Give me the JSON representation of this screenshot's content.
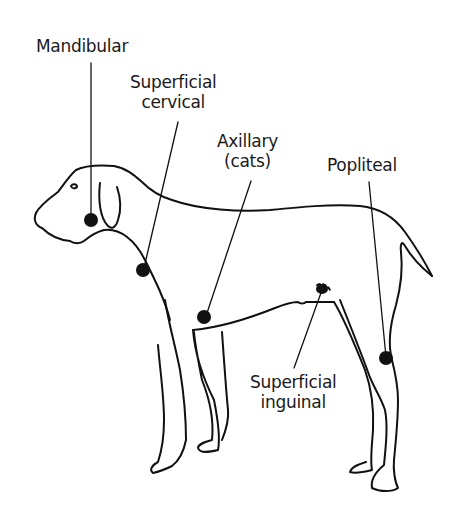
{
  "diagram": {
    "labels": {
      "mandibular": "Mandibular",
      "superficial_cervical_1": "Superficial",
      "superficial_cervical_2": "cervical",
      "axillary_1": "Axillary",
      "axillary_2": "(cats)",
      "popliteal": "Popliteal",
      "superficial_inguinal_1": "Superficial",
      "superficial_inguinal_2": "inguinal"
    },
    "colors": {
      "line": "#111111",
      "node": "#111111",
      "background": "#ffffff"
    }
  }
}
